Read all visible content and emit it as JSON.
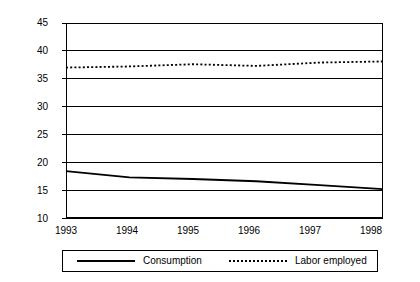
{
  "chart_data": {
    "type": "line",
    "title": "",
    "subtitle": "",
    "xlabel": "",
    "ylabel": "",
    "categories": [
      "1993",
      "1994",
      "1995",
      "1996",
      "1997",
      "1998"
    ],
    "x": [
      1993,
      1994,
      1995,
      1996,
      1997,
      1998
    ],
    "ylim": [
      10,
      45
    ],
    "yticks": [
      10,
      15,
      20,
      25,
      30,
      35,
      40,
      45
    ],
    "ytick_labels": [
      "10",
      "15",
      "20",
      "25",
      "30",
      "35",
      "40",
      "45"
    ],
    "xtick_labels": [
      "1993",
      "1994",
      "1995",
      "1996",
      "1997",
      "1998"
    ],
    "grid": "horizontal",
    "legend_position": "bottom-outside",
    "series": [
      {
        "name": "Consumption",
        "style": "solid",
        "color": "#000000",
        "values": [
          18.4,
          17.3,
          17.0,
          16.6,
          15.9,
          15.2
        ]
      },
      {
        "name": "Labor employed",
        "style": "dotted",
        "color": "#000000",
        "values": [
          37.0,
          37.2,
          37.6,
          37.3,
          37.9,
          38.1
        ]
      }
    ],
    "annotations": []
  },
  "axes": {
    "y_ticks": [
      {
        "label": "45",
        "value": 45
      },
      {
        "label": "40",
        "value": 40
      },
      {
        "label": "35",
        "value": 35
      },
      {
        "label": "30",
        "value": 30
      },
      {
        "label": "25",
        "value": 25
      },
      {
        "label": "20",
        "value": 20
      },
      {
        "label": "15",
        "value": 15
      },
      {
        "label": "10",
        "value": 10
      }
    ],
    "x_ticks": [
      {
        "label": "1993",
        "value": 1993
      },
      {
        "label": "1994",
        "value": 1994
      },
      {
        "label": "1995",
        "value": 1995
      },
      {
        "label": "1996",
        "value": 1996
      },
      {
        "label": "1997",
        "value": 1997
      },
      {
        "label": "1998",
        "value": 1998
      }
    ]
  },
  "legend": {
    "entries": [
      {
        "label": "Consumption",
        "style": "solid"
      },
      {
        "label": "Labor employed",
        "style": "dotted"
      }
    ]
  }
}
